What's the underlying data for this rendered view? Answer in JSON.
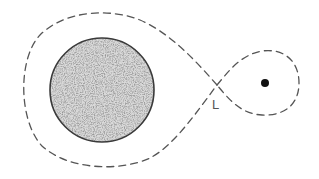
{
  "diagram": {
    "type": "roche-lobe-orbit-diagram",
    "labels": {
      "lagrange_point": "L"
    },
    "elements": {
      "primary_body": {
        "shape": "circle",
        "fill": "stippled",
        "cx": 102,
        "cy": 90,
        "r": 52
      },
      "secondary_body": {
        "shape": "dot",
        "cx": 265,
        "cy": 83,
        "r": 4
      },
      "equipotential_curve": {
        "style": "dashed",
        "shape": "figure-eight",
        "crossing": [
          217,
          85
        ]
      }
    },
    "colors": {
      "stroke": "#555555",
      "stipple_dark": "#4a4a4a",
      "stipple_light": "#bdbdbd",
      "background": "#ffffff"
    }
  }
}
